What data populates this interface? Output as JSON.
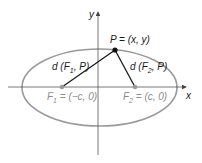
{
  "diagram": {
    "axes": {
      "x_label": "x",
      "y_label": "y"
    },
    "point": {
      "label": "P = (x, y)"
    },
    "focus1": {
      "name": "F",
      "sub": "1",
      "rest": " = (−c, 0)"
    },
    "focus2": {
      "name": "F",
      "sub": "2",
      "rest": " = (c, 0)"
    },
    "dist1": {
      "pre": "d (F",
      "sub": "1",
      "post": ", P)"
    },
    "dist2": {
      "pre": "d (F",
      "sub": "2",
      "post": ", P)"
    },
    "colors": {
      "ellipse": "#9a9a9a",
      "axes": "#555555",
      "segments": "#1a1a1a",
      "focus_label": "#8c8c8c",
      "text": "#1a1a1a"
    }
  }
}
